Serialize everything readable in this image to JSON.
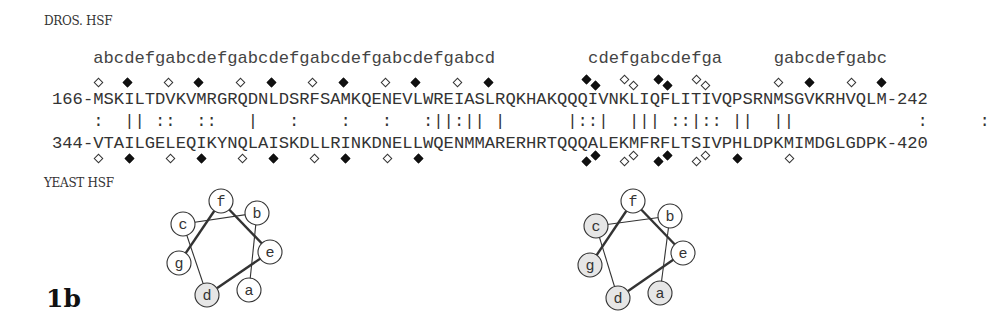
{
  "labels": {
    "top_species": "DROS. HSF",
    "bottom_species": "YEAST HSF",
    "figure_label": "1b"
  },
  "alignment": {
    "char_origin_x": 52,
    "char_pitch": 10.31,
    "heptad_groups": [
      {
        "start_index": 4,
        "text": "abcdefgabcdefgabcdefgabcdefgabcdefgabcd"
      },
      {
        "start_index": 52,
        "text": "cdefgabcdefga"
      },
      {
        "start_index": 70,
        "text": "gabcdefgabc"
      }
    ],
    "top_sequence": "166-MSKILTDVKVMRGRQDNLDSRFSAMKQENEVLWREIASLRQKHAKQQQIVNKLIQFLITIVQPSRNMSGVKRHVQLM-242",
    "match_line": "    :  || ::  ::   |   :    :   :   :||:|| |      |::|  ||| ::|:: ||  ||            :     :",
    "bottom_sequence": "344-VTAILGELEQIKYNQLAISKDLLRINKDNELLWQENMMARERHRTQQQALEKMFRFLTSIVPHLDPKMIMDGLGDPK-420",
    "top_markers": [
      {
        "index": 4.5,
        "type": "open",
        "dy": 0
      },
      {
        "index": 7.3,
        "type": "filled",
        "dy": 0
      },
      {
        "index": 11.3,
        "type": "open",
        "dy": 0
      },
      {
        "index": 14.2,
        "type": "filled",
        "dy": 0
      },
      {
        "index": 18.3,
        "type": "open",
        "dy": 0
      },
      {
        "index": 21.3,
        "type": "filled",
        "dy": 0
      },
      {
        "index": 25.3,
        "type": "open",
        "dy": 0
      },
      {
        "index": 28.3,
        "type": "filled",
        "dy": 0
      },
      {
        "index": 32.3,
        "type": "open",
        "dy": 0
      },
      {
        "index": 35.3,
        "type": "filled",
        "dy": 0
      },
      {
        "index": 39.3,
        "type": "open",
        "dy": 0
      },
      {
        "index": 42.3,
        "type": "filled",
        "dy": 0
      },
      {
        "index": 51.8,
        "type": "filled",
        "dy": -3
      },
      {
        "index": 52.7,
        "type": "filled",
        "dy": 3
      },
      {
        "index": 55.5,
        "type": "open",
        "dy": -3
      },
      {
        "index": 56.4,
        "type": "open",
        "dy": 3
      },
      {
        "index": 58.8,
        "type": "filled",
        "dy": -3
      },
      {
        "index": 59.7,
        "type": "filled",
        "dy": 3
      },
      {
        "index": 62.5,
        "type": "open",
        "dy": -3
      },
      {
        "index": 63.4,
        "type": "open",
        "dy": 3
      },
      {
        "index": 70.5,
        "type": "open",
        "dy": 0
      },
      {
        "index": 73.5,
        "type": "filled",
        "dy": 0
      },
      {
        "index": 77.5,
        "type": "open",
        "dy": 0
      },
      {
        "index": 80.5,
        "type": "filled",
        "dy": 0
      }
    ],
    "bottom_markers": [
      {
        "index": 4.5,
        "type": "open",
        "dy": 0
      },
      {
        "index": 7.5,
        "type": "filled",
        "dy": 0
      },
      {
        "index": 11.5,
        "type": "open",
        "dy": 0
      },
      {
        "index": 14.5,
        "type": "filled",
        "dy": 0
      },
      {
        "index": 18.5,
        "type": "open",
        "dy": 0
      },
      {
        "index": 21.5,
        "type": "filled",
        "dy": 0
      },
      {
        "index": 25.5,
        "type": "open",
        "dy": 0
      },
      {
        "index": 28.5,
        "type": "filled",
        "dy": 0
      },
      {
        "index": 32.5,
        "type": "open",
        "dy": 0
      },
      {
        "index": 35.5,
        "type": "filled",
        "dy": 0
      },
      {
        "index": 51.8,
        "type": "filled",
        "dy": 3
      },
      {
        "index": 52.7,
        "type": "filled",
        "dy": -3
      },
      {
        "index": 55.5,
        "type": "open",
        "dy": 3
      },
      {
        "index": 56.4,
        "type": "open",
        "dy": -3
      },
      {
        "index": 58.8,
        "type": "filled",
        "dy": 3
      },
      {
        "index": 59.7,
        "type": "filled",
        "dy": -3
      },
      {
        "index": 62.5,
        "type": "open",
        "dy": 3
      },
      {
        "index": 63.4,
        "type": "open",
        "dy": -3
      },
      {
        "index": 66.5,
        "type": "filled",
        "dy": 0
      },
      {
        "index": 71.5,
        "type": "open",
        "dy": 0
      }
    ]
  },
  "helical_wheels": [
    {
      "name": "wheel-left",
      "cx": 218,
      "cy": 248,
      "positions": [
        {
          "label": "f",
          "x": 221,
          "y": 201,
          "shaded": false
        },
        {
          "label": "b",
          "x": 257,
          "y": 213,
          "shaded": false
        },
        {
          "label": "c",
          "x": 183,
          "y": 224,
          "shaded": false
        },
        {
          "label": "e",
          "x": 270,
          "y": 252,
          "shaded": false
        },
        {
          "label": "g",
          "x": 179,
          "y": 263,
          "shaded": false
        },
        {
          "label": "d",
          "x": 207,
          "y": 295,
          "shaded": true
        },
        {
          "label": "a",
          "x": 249,
          "y": 290,
          "shaded": false
        }
      ]
    },
    {
      "name": "wheel-right",
      "cx": 641,
      "cy": 248,
      "positions": [
        {
          "label": "f",
          "x": 633,
          "y": 201,
          "shaded": false
        },
        {
          "label": "b",
          "x": 670,
          "y": 216,
          "shaded": false
        },
        {
          "label": "c",
          "x": 596,
          "y": 226,
          "shaded": true
        },
        {
          "label": "e",
          "x": 683,
          "y": 253,
          "shaded": false
        },
        {
          "label": "g",
          "x": 590,
          "y": 265,
          "shaded": true
        },
        {
          "label": "d",
          "x": 618,
          "y": 298,
          "shaded": true
        },
        {
          "label": "a",
          "x": 660,
          "y": 293,
          "shaded": true
        }
      ]
    }
  ],
  "colors": {
    "ink": "#333333",
    "shade": "#e6e6e6",
    "background": "#ffffff"
  }
}
